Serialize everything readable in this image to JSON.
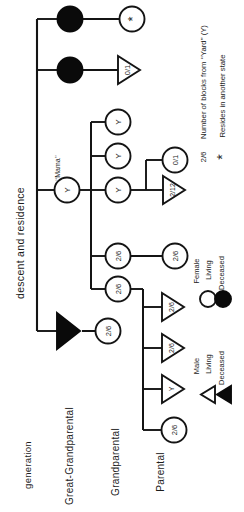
{
  "figure": {
    "type": "pedigree-chart",
    "orientation": "rotated-90-counterclockwise",
    "axis_labels": {
      "generation": "generation",
      "descent_and_residence": "descent and residence"
    },
    "generations": [
      {
        "id": "great-grandparental",
        "label": "Great-Grandparental"
      },
      {
        "id": "grandparental",
        "label": "Grandparental"
      },
      {
        "id": "parental",
        "label": "Parental"
      }
    ],
    "annotations": {
      "mama": "‘‘Mama’’"
    },
    "legend": {
      "male": {
        "group_label": "Male",
        "living_label": "Living",
        "deceased_label": "Deceased"
      },
      "female": {
        "group_label": "Female",
        "living_label": "Living",
        "deceased_label": "Deceased"
      },
      "notes": [
        {
          "key": "2/6",
          "text": "Number of blocks from ‘‘Yard’’ (Y)"
        },
        {
          "key": "*",
          "text": "Resides in another state"
        }
      ]
    },
    "nodes": [
      {
        "id": "ggp-f1",
        "sex": "female",
        "status": "deceased",
        "label": "",
        "generation": "great-grandparental"
      },
      {
        "id": "ggp-f2",
        "sex": "female",
        "status": "deceased",
        "label": "",
        "generation": "great-grandparental"
      },
      {
        "id": "ggp-f3",
        "sex": "female",
        "status": "living",
        "label": "Y",
        "generation": "great-grandparental",
        "name": "‘‘Mama’’"
      },
      {
        "id": "ggp-m1",
        "sex": "male",
        "status": "deceased",
        "label": "",
        "generation": "great-grandparental"
      },
      {
        "id": "gp-f1",
        "sex": "female",
        "status": "living",
        "label": "*",
        "generation": "grandparental"
      },
      {
        "id": "gp-m1",
        "sex": "male",
        "status": "living",
        "label": "0/1",
        "generation": "grandparental"
      },
      {
        "id": "gp-f2",
        "sex": "female",
        "status": "living",
        "label": "Y",
        "generation": "grandparental"
      },
      {
        "id": "gp-f3",
        "sex": "female",
        "status": "living",
        "label": "Y",
        "generation": "grandparental"
      },
      {
        "id": "gp-f4",
        "sex": "female",
        "status": "living",
        "label": "Y",
        "generation": "grandparental"
      },
      {
        "id": "gp-f5",
        "sex": "female",
        "status": "living",
        "label": "2/6",
        "generation": "grandparental"
      },
      {
        "id": "gp-f6",
        "sex": "female",
        "status": "living",
        "label": "2/6",
        "generation": "grandparental"
      },
      {
        "id": "gp-f7",
        "sex": "female",
        "status": "living",
        "label": "2/6",
        "generation": "grandparental"
      },
      {
        "id": "par-f1",
        "sex": "female",
        "status": "living",
        "label": "0/1",
        "generation": "parental"
      },
      {
        "id": "par-m1",
        "sex": "male",
        "status": "living",
        "label": "2/12",
        "generation": "parental"
      },
      {
        "id": "par-f2",
        "sex": "female",
        "status": "living",
        "label": "2/6",
        "generation": "parental"
      },
      {
        "id": "par-m2",
        "sex": "male",
        "status": "living",
        "label": "2/6",
        "generation": "parental"
      },
      {
        "id": "par-m3",
        "sex": "male",
        "status": "living",
        "label": "2/6",
        "generation": "parental"
      },
      {
        "id": "par-m4",
        "sex": "male",
        "status": "living",
        "label": "Y",
        "generation": "parental"
      },
      {
        "id": "par-f3",
        "sex": "female",
        "status": "living",
        "label": "2/6",
        "generation": "parental"
      }
    ],
    "colors": {
      "line": "#141414",
      "fill_living": "#ffffff",
      "fill_deceased": "#0a0a0a",
      "text": "#1c1c1c",
      "background": "#ffffff"
    }
  }
}
